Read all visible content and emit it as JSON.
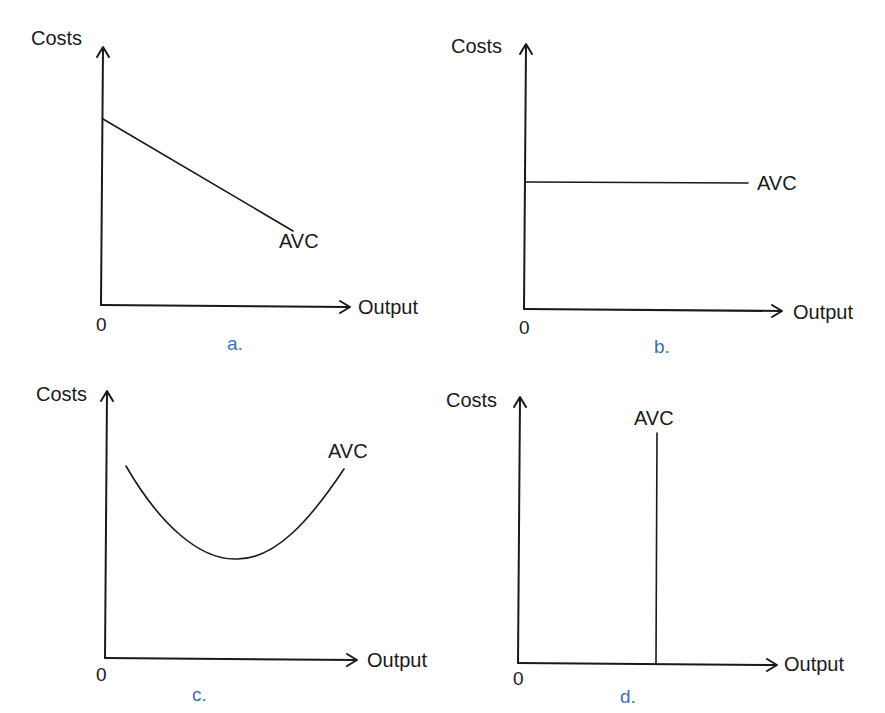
{
  "panels": [
    {
      "id": "a",
      "caption": "a.",
      "ylabel": "Costs",
      "xlabel": "Output",
      "origin": "0",
      "curve_label": "AVC",
      "shape": "downward-sloping line"
    },
    {
      "id": "b",
      "caption": "b.",
      "ylabel": "Costs",
      "xlabel": "Output",
      "origin": "0",
      "curve_label": "AVC",
      "shape": "horizontal line"
    },
    {
      "id": "c",
      "caption": "c.",
      "ylabel": "Costs",
      "xlabel": "Output",
      "origin": "0",
      "curve_label": "AVC",
      "shape": "U-shaped curve"
    },
    {
      "id": "d",
      "caption": "d.",
      "ylabel": "Costs",
      "xlabel": "Output",
      "origin": "0",
      "curve_label": "AVC",
      "shape": "vertical line"
    }
  ],
  "colors": {
    "ink": "#1a1a1a",
    "caption": "#3b6fb6"
  }
}
